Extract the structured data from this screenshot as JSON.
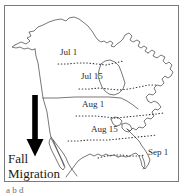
{
  "figure": {
    "kind": "map-figure",
    "frame_color": "#7b7b7b",
    "background": "#ffffff"
  },
  "map": {
    "region": "North America",
    "outline_color": "#3d3d3d",
    "isochrone_color": "#3a3a3a",
    "isochrone_style": "dotted"
  },
  "isochrones": [
    {
      "id": "jul-1",
      "label": "Jul 1"
    },
    {
      "id": "jul-15",
      "label": "Jul 15"
    },
    {
      "id": "aug-1",
      "label": "Aug 1"
    },
    {
      "id": "aug-15",
      "label": "Aug 15"
    },
    {
      "id": "sep-1",
      "label": "Sep 1"
    }
  ],
  "annotation": {
    "arrow_direction": "down",
    "arrow_color": "#000000",
    "line1": "Fall",
    "line2": "Migration"
  },
  "caption": {
    "text": "a b d"
  }
}
